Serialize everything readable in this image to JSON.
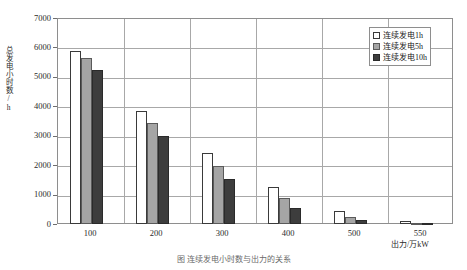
{
  "chart_data": {
    "type": "bar",
    "title": "",
    "xlabel": "出力/万kW",
    "ylabel": "总发电小时数/h",
    "categories": [
      "100",
      "200",
      "300",
      "400",
      "500",
      "550"
    ],
    "series": [
      {
        "name": "连续发电1h",
        "values": [
          5870,
          3850,
          2400,
          1270,
          430,
          100
        ]
      },
      {
        "name": "连续发电5h",
        "values": [
          5650,
          3450,
          1980,
          900,
          230,
          40
        ]
      },
      {
        "name": "连续发电10h",
        "values": [
          5220,
          2980,
          1530,
          530,
          130,
          20
        ]
      }
    ],
    "ylim": [
      0,
      7000
    ],
    "ytick_step": 1000,
    "yticks": [
      "0",
      "1000",
      "2000",
      "3000",
      "4000",
      "5000",
      "6000",
      "7000"
    ],
    "grid": true,
    "legend_position": "top-right",
    "colors": [
      "#ffffff",
      "#a5a5a5",
      "#3d3d3d"
    ]
  },
  "caption": {
    "text": "图 连续发电小时数与出力的关系"
  }
}
